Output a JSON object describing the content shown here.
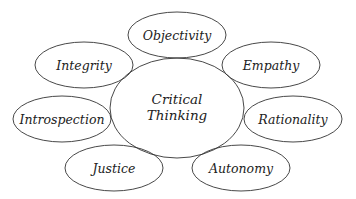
{
  "diagram": {
    "type": "concept-map",
    "center": {
      "label_line1": "Critical",
      "label_line2": "Thinking",
      "cx": 177,
      "cy": 108,
      "rx": 67,
      "ry": 50
    },
    "nodes": [
      {
        "id": "objectivity",
        "label": "Objectivity",
        "cx": 177,
        "cy": 35,
        "rx": 49,
        "ry": 23
      },
      {
        "id": "integrity",
        "label": "Integrity",
        "cx": 84,
        "cy": 65,
        "rx": 49,
        "ry": 23
      },
      {
        "id": "empathy",
        "label": "Empathy",
        "cx": 271,
        "cy": 65,
        "rx": 49,
        "ry": 23
      },
      {
        "id": "introspection",
        "label": "Introspection",
        "cx": 62,
        "cy": 119,
        "rx": 49,
        "ry": 23
      },
      {
        "id": "rationality",
        "label": "Rationality",
        "cx": 293,
        "cy": 119,
        "rx": 49,
        "ry": 23
      },
      {
        "id": "justice",
        "label": "Justice",
        "cx": 114,
        "cy": 168,
        "rx": 49,
        "ry": 23
      },
      {
        "id": "autonomy",
        "label": "Autonomy",
        "cx": 241,
        "cy": 168,
        "rx": 49,
        "ry": 23
      }
    ],
    "colors": {
      "stroke": "#333333",
      "text": "#222222",
      "background": "#ffffff"
    }
  }
}
